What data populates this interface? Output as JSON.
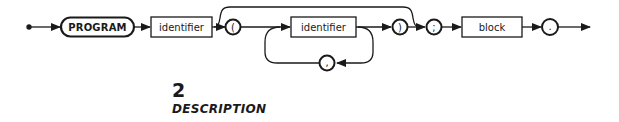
{
  "diagram": {
    "type": "syntax-diagram",
    "keyword": "PROGRAM",
    "program_identifier": "identifier",
    "open_paren": "(",
    "param_identifier": "identifier",
    "separator": ",",
    "close_paren": ")",
    "semicolon": ";",
    "block": "block",
    "period": ".",
    "line_color": "#1a1a1a"
  },
  "section": {
    "number": "2",
    "title": "DESCRIPTION"
  }
}
